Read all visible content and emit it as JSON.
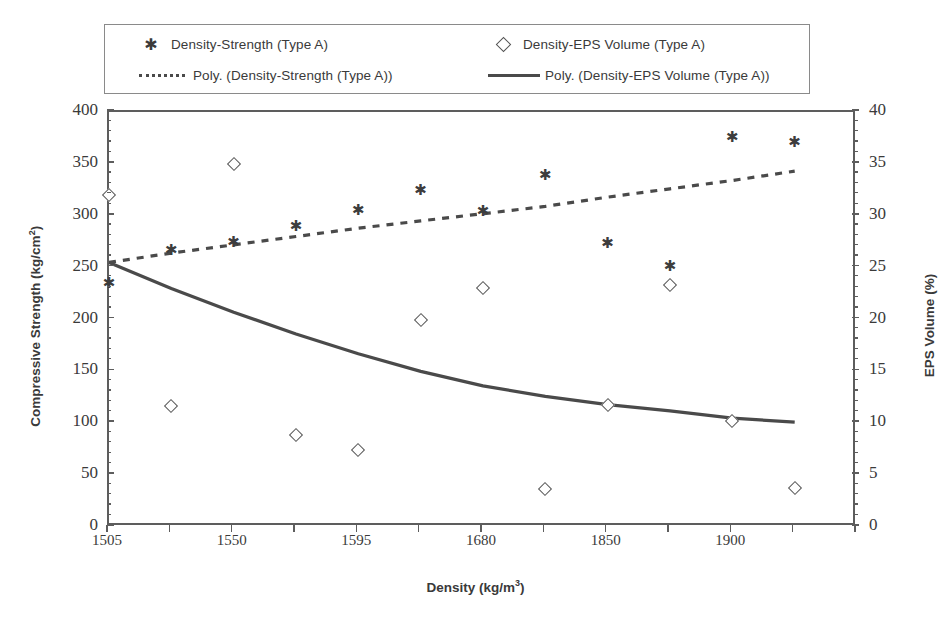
{
  "legend": {
    "items": [
      {
        "key": "asterisk-marker",
        "label": "Density-Strength (Type A)"
      },
      {
        "key": "diamond-marker",
        "label": "Density-EPS Volume (Type A)"
      },
      {
        "key": "dotted-line",
        "label": "Poly. (Density-Strength (Type A))"
      },
      {
        "key": "solid-line",
        "label": "Poly. (Density-EPS Volume (Type A))"
      }
    ]
  },
  "axes": {
    "x_title_main": "Density (kg/m",
    "x_title_sup": "3",
    "x_title_tail": ")",
    "y_left_title_main": "Compressive Strength (kg/cm",
    "y_left_title_sup": "2",
    "y_left_title_tail": ")",
    "y_right_title": "EPS Volume (%)"
  },
  "chart_data": {
    "type": "scatter",
    "title": "",
    "xlabel": "Density (kg/m3)",
    "ylabel": "Compressive Strength (kg/cm2)",
    "y2label": "EPS Volume (%)",
    "ylim": [
      0,
      400
    ],
    "y2lim": [
      0,
      40
    ],
    "yticks": [
      0,
      50,
      100,
      150,
      200,
      250,
      300,
      350,
      400
    ],
    "y2ticks": [
      0,
      5,
      10,
      15,
      20,
      25,
      30,
      35,
      40
    ],
    "y_minor_step": 10,
    "y2_minor_step": 1,
    "grid": false,
    "legend_position": "top",
    "x_tick_count": 13,
    "x_tick_labels": [
      "1505",
      "",
      "1550",
      "",
      "1595",
      "",
      "1680",
      "",
      "1850",
      "",
      "1900",
      "",
      ""
    ],
    "x_categories": [
      "1505",
      "1520",
      "1550",
      "1565",
      "1595",
      "1640",
      "1680",
      "1720",
      "1850",
      "1875",
      "1900",
      "1925",
      "1950"
    ],
    "series": [
      {
        "name": "Density-Strength (Type A)",
        "axis": "left",
        "marker": "asterisk",
        "unit": "kg/cm2",
        "x_index": [
          0,
          1,
          2,
          3,
          4,
          5,
          6,
          7,
          8,
          9,
          10,
          11
        ],
        "values": [
          235,
          267,
          275,
          290,
          306,
          325,
          305,
          339,
          274,
          252,
          376,
          371
        ]
      },
      {
        "name": "Density-EPS Volume (Type A)",
        "axis": "right",
        "marker": "diamond",
        "unit": "%",
        "x_index": [
          0,
          1,
          2,
          3,
          4,
          5,
          6,
          7,
          8,
          9,
          10,
          11
        ],
        "values": [
          32.0,
          11.7,
          35.0,
          8.9,
          7.4,
          20.0,
          23.0,
          3.7,
          11.8,
          23.3,
          10.2,
          3.8
        ]
      }
    ],
    "trendlines": [
      {
        "name": "Poly. (Density-Strength (Type A))",
        "axis": "left",
        "style": "dotted",
        "points_left_scale": [
          [
            0,
            255
          ],
          [
            1,
            264
          ],
          [
            2,
            272
          ],
          [
            3,
            280
          ],
          [
            4,
            288
          ],
          [
            5,
            295
          ],
          [
            6,
            302
          ],
          [
            7,
            309
          ],
          [
            8,
            318
          ],
          [
            9,
            326
          ],
          [
            10,
            334
          ],
          [
            11,
            343
          ]
        ]
      },
      {
        "name": "Poly. (Density-EPS Volume (Type A))",
        "axis": "right",
        "style": "solid",
        "points_right_scale": [
          [
            0,
            25.5
          ],
          [
            1,
            23.0
          ],
          [
            2,
            20.7
          ],
          [
            3,
            18.6
          ],
          [
            4,
            16.7
          ],
          [
            5,
            15.0
          ],
          [
            6,
            13.6
          ],
          [
            7,
            12.6
          ],
          [
            8,
            11.8
          ],
          [
            9,
            11.2
          ],
          [
            10,
            10.5
          ],
          [
            11,
            10.1
          ]
        ]
      }
    ]
  }
}
